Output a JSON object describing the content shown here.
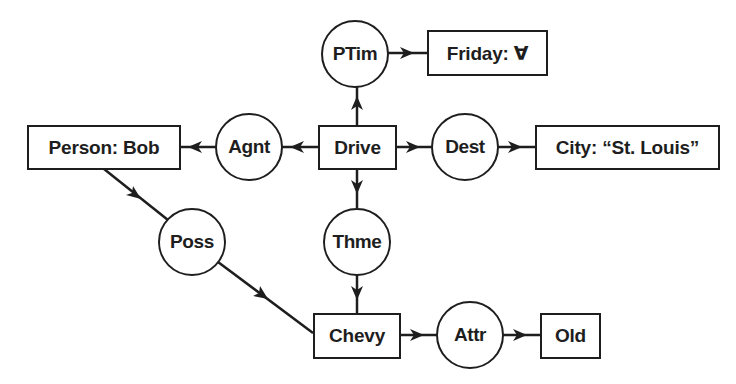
{
  "diagram": {
    "type": "conceptual-graph",
    "colors": {
      "stroke": "#1e1e1e",
      "background": "#ffffff",
      "text": "#1e1e1e"
    },
    "concepts": {
      "drive": {
        "label": "Drive"
      },
      "person": {
        "label": "Person: Bob"
      },
      "friday": {
        "label": "Friday: ∀"
      },
      "city": {
        "label": "City: “St. Louis”"
      },
      "chevy": {
        "label": "Chevy"
      },
      "old": {
        "label": "Old"
      }
    },
    "relations": {
      "ptim": {
        "label": "PTim"
      },
      "agnt": {
        "label": "Agnt"
      },
      "dest": {
        "label": "Dest"
      },
      "thme": {
        "label": "Thme"
      },
      "poss": {
        "label": "Poss"
      },
      "attr": {
        "label": "Attr"
      }
    },
    "edges": [
      {
        "from": "Drive",
        "to": "PTim"
      },
      {
        "from": "PTim",
        "to": "Friday: ∀"
      },
      {
        "from": "Drive",
        "to": "Agnt"
      },
      {
        "from": "Agnt",
        "to": "Person: Bob"
      },
      {
        "from": "Drive",
        "to": "Dest"
      },
      {
        "from": "Dest",
        "to": "City: “St. Louis”"
      },
      {
        "from": "Drive",
        "to": "Thme"
      },
      {
        "from": "Thme",
        "to": "Chevy"
      },
      {
        "from": "Person: Bob",
        "to": "Poss"
      },
      {
        "from": "Poss",
        "to": "Chevy"
      },
      {
        "from": "Chevy",
        "to": "Attr"
      },
      {
        "from": "Attr",
        "to": "Old"
      }
    ]
  }
}
